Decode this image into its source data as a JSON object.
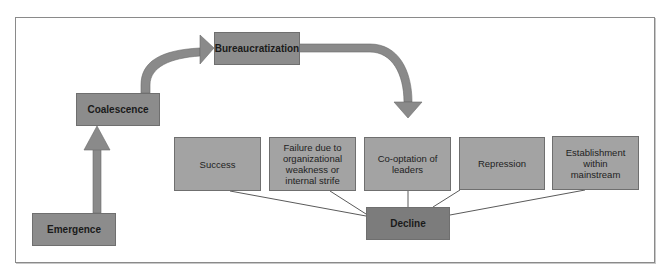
{
  "diagram": {
    "title": "",
    "colors": {
      "stage_fill": "#8c8c8c",
      "outcome_fill": "#a3a3a3",
      "decline_fill": "#7c7c7c",
      "arrow_fill": "#8a8a8a",
      "line": "#5a5a5a",
      "frame": "#8a8a8a"
    },
    "stages": [
      {
        "id": "emergence",
        "label": "Emergence"
      },
      {
        "id": "coalescence",
        "label": "Coalescence"
      },
      {
        "id": "bureaucratization",
        "label": "Bureaucratization"
      },
      {
        "id": "decline",
        "label": "Decline"
      }
    ],
    "outcomes": [
      {
        "id": "success",
        "label": "Success"
      },
      {
        "id": "failure",
        "label": "Failure due to organizational weakness or internal strife"
      },
      {
        "id": "cooptation",
        "label": "Co-optation of leaders"
      },
      {
        "id": "repression",
        "label": "Repression"
      },
      {
        "id": "establishment",
        "label": "Establishment within mainstream"
      }
    ],
    "edges": [
      {
        "from": "emergence",
        "to": "coalescence",
        "type": "arrow"
      },
      {
        "from": "coalescence",
        "to": "bureaucratization",
        "type": "curved-arrow"
      },
      {
        "from": "bureaucratization",
        "to": "outcomes",
        "type": "curved-arrow"
      },
      {
        "from": "success",
        "to": "decline",
        "type": "line"
      },
      {
        "from": "failure",
        "to": "decline",
        "type": "line"
      },
      {
        "from": "cooptation",
        "to": "decline",
        "type": "line"
      },
      {
        "from": "repression",
        "to": "decline",
        "type": "line"
      },
      {
        "from": "establishment",
        "to": "decline",
        "type": "line"
      }
    ]
  }
}
